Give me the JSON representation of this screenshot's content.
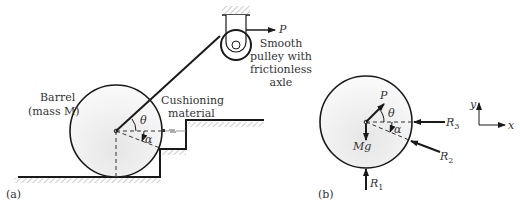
{
  "panel_a": {
    "tag": "(a)",
    "barrel_label_1": "Barrel",
    "barrel_label_2": "(mass M)",
    "cushion_label_1": "Cushioning",
    "cushion_label_2": "material",
    "pulley_label_1": "Smooth",
    "pulley_label_2": "pulley with",
    "pulley_label_3": "frictionless",
    "pulley_label_4": "axle",
    "force_P": "P",
    "angle_theta": "θ",
    "angle_alpha": "α"
  },
  "panel_b": {
    "tag": "(b)",
    "force_P": "P",
    "weight": "Mg",
    "angle_theta": "θ",
    "angle_alpha": "α",
    "R1": "R",
    "R1_sub": "1",
    "R2": "R",
    "R2_sub": "2",
    "R3": "R",
    "R3_sub": "3",
    "axis_y": "y",
    "axis_x": "x"
  },
  "colors": {
    "line": "#1a1a1a",
    "barrel_fill": "#ececec",
    "hatch": "#999999"
  }
}
